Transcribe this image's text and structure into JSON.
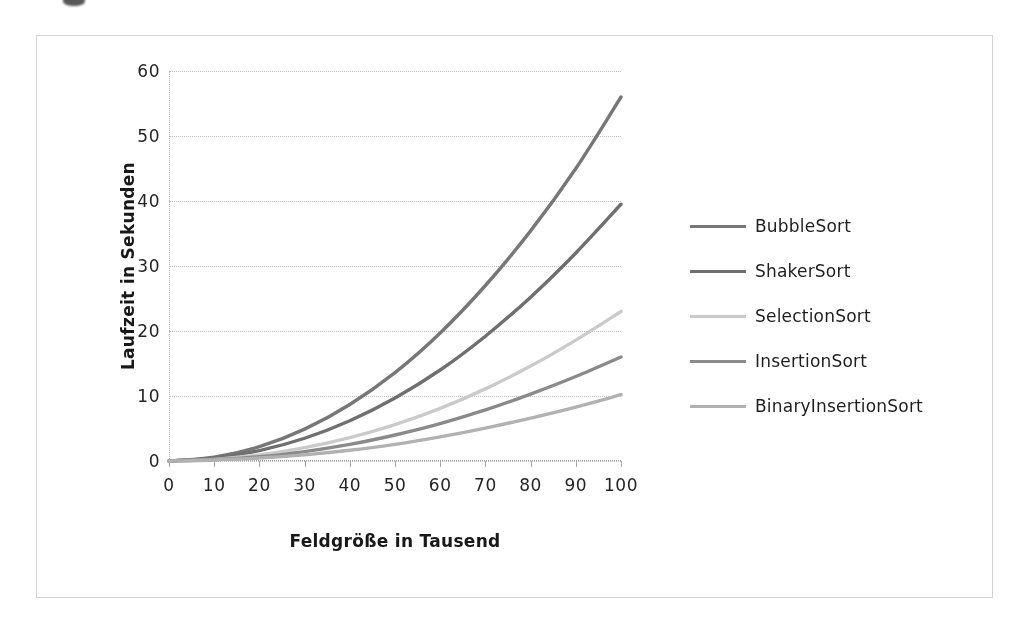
{
  "chart_data": {
    "type": "line",
    "title": "",
    "xlabel": "Feldgröße in Tausend",
    "ylabel": "Laufzeit in Sekunden",
    "x": [
      0,
      10,
      20,
      30,
      40,
      50,
      60,
      70,
      80,
      90,
      100
    ],
    "xlim": [
      0,
      100
    ],
    "ylim": [
      0,
      60
    ],
    "xticks": [
      "0",
      "10",
      "20",
      "30",
      "40",
      "50",
      "60",
      "70",
      "80",
      "90",
      "100"
    ],
    "yticks": [
      "0",
      "10",
      "20",
      "30",
      "40",
      "50",
      "60"
    ],
    "grid": true,
    "legend_position": "right",
    "series": [
      {
        "name": "BubbleSort",
        "color": "#777777",
        "values": [
          0,
          0.6,
          2.2,
          4.9,
          8.7,
          13.6,
          19.7,
          27.0,
          35.4,
          45.0,
          56.0
        ]
      },
      {
        "name": "ShakerSort",
        "color": "#6f6f6f",
        "values": [
          0,
          0.45,
          1.6,
          3.5,
          6.2,
          9.7,
          14.0,
          19.2,
          25.2,
          32.0,
          39.5
        ]
      },
      {
        "name": "SelectionSort",
        "color": "#c9c9c9",
        "values": [
          0,
          0.25,
          0.95,
          2.05,
          3.6,
          5.6,
          8.1,
          11.1,
          14.6,
          18.6,
          23.0
        ]
      },
      {
        "name": "InsertionSort",
        "color": "#8a8a8a",
        "values": [
          0,
          0.2,
          0.65,
          1.45,
          2.55,
          4.0,
          5.75,
          7.85,
          10.3,
          13.0,
          16.0
        ]
      },
      {
        "name": "BinaryInsertionSort",
        "color": "#b0b0b0",
        "values": [
          0,
          0.15,
          0.45,
          0.95,
          1.65,
          2.55,
          3.7,
          5.05,
          6.6,
          8.3,
          10.2
        ]
      }
    ]
  }
}
